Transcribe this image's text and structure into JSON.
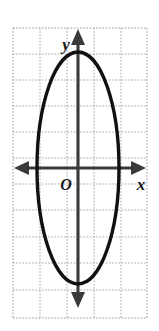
{
  "figure": {
    "background_color": "#ffffff",
    "width": 159,
    "height": 331
  },
  "labels": {
    "x_axis": "x",
    "y_axis": "y",
    "origin": "O"
  },
  "colors": {
    "curve": "#111111",
    "axis": "#3a3a3a",
    "grid": "#a8a8a8",
    "label": "#1a1a1a",
    "background": "#ffffff"
  },
  "chart_data": {
    "type": "scatter",
    "title": "",
    "xlabel": "x",
    "ylabel": "y",
    "grid": true,
    "legend": null,
    "axis_style": {
      "x_arrows": "both",
      "y_arrows": "both",
      "origin_label": "O",
      "tick_labels": false,
      "grid_spacing_units": 1
    },
    "xlim": [
      -2.4,
      2.55
    ],
    "ylim": [
      -5.55,
      5.2
    ],
    "grid_columns": 5,
    "grid_rows": 11,
    "series": [
      {
        "name": "ellipse",
        "type": "ellipse",
        "center": [
          0,
          0
        ],
        "semi_axis_x": 1.5,
        "semi_axis_y": 4.3,
        "orientation": "vertical",
        "equation": "x^2/1.5^2 + y^2/4.3^2 = 1",
        "vertices": [
          [
            0,
            4.3
          ],
          [
            0,
            -4.3
          ]
        ],
        "co_vertices": [
          [
            -1.5,
            0
          ],
          [
            1.5,
            0
          ]
        ],
        "stroke_width_px": 3.4
      }
    ]
  },
  "geometry_px": {
    "origin": [
      78,
      168
    ],
    "cell_size": 27,
    "grid_left": 13,
    "grid_right": 147,
    "grid_top": 28,
    "grid_bottom": 318,
    "ellipse_rx": 41,
    "ellipse_ry": 116,
    "vertical_gridlines": [
      13,
      40,
      67,
      94,
      121,
      147
    ],
    "horizontal_gridlines": [
      28,
      54,
      80,
      106,
      132,
      158,
      184,
      210,
      237,
      263,
      290,
      318
    ]
  }
}
